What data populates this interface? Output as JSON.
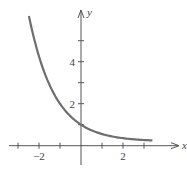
{
  "chart_data": {
    "type": "line",
    "title": "",
    "xlabel": "x",
    "ylabel": "y",
    "xlim": [
      -3.4,
      4.7
    ],
    "ylim": [
      -0.9,
      6.5
    ],
    "x_ticks": [
      -3,
      -2,
      -1,
      1,
      2,
      3
    ],
    "x_tick_labels": [
      {
        "value": -2,
        "label": "−2"
      },
      {
        "value": 2,
        "label": "2"
      }
    ],
    "y_ticks": [
      1,
      2,
      3,
      4,
      5
    ],
    "y_tick_labels": [
      {
        "value": 2,
        "label": "2"
      },
      {
        "value": 4,
        "label": "4"
      }
    ],
    "grid": false,
    "series": [
      {
        "name": "curve",
        "color": "#6e6e6e",
        "x": [
          -2.48,
          -2.0,
          -1.5,
          -1.0,
          -0.5,
          0.0,
          0.5,
          1.0,
          1.5,
          2.0,
          2.5,
          3.0,
          3.4
        ],
        "values": [
          6.2,
          4.25,
          2.89,
          2.0,
          1.4,
          1.0,
          0.73,
          0.56,
          0.44,
          0.36,
          0.31,
          0.27,
          0.25
        ]
      }
    ]
  },
  "axes": {
    "x_label": "x",
    "y_label": "y"
  }
}
